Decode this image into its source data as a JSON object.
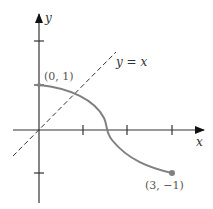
{
  "diagram": {
    "axes": {
      "x_label": "x",
      "y_label": "y",
      "x_ticks": [
        1,
        2,
        3
      ],
      "y_ticks": [
        2,
        1,
        -1
      ]
    },
    "curve": {
      "start_label": "(0, 1)",
      "end_label": "(3, −1)",
      "color": "#808080"
    },
    "reference_line": {
      "label": "y = x",
      "style": "dashed"
    }
  }
}
